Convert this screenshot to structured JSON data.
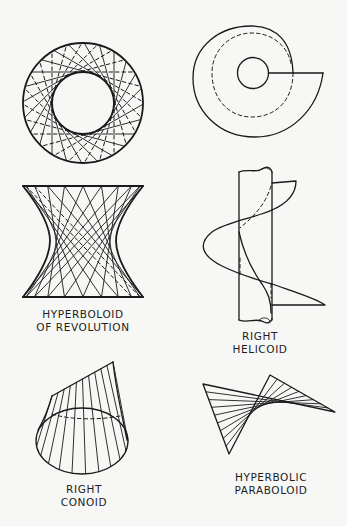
{
  "figures": [
    {
      "id": "hyperboloid",
      "label_lines": [
        "HYPERBOLOID",
        "OF REVOLUTION"
      ],
      "views": [
        "top-view",
        "side-view"
      ]
    },
    {
      "id": "helicoid",
      "label_lines": [
        "RIGHT",
        "HELICOID"
      ],
      "views": [
        "top-view",
        "side-view"
      ]
    },
    {
      "id": "conoid",
      "label_lines": [
        "RIGHT",
        "CONOID"
      ],
      "views": [
        "perspective"
      ]
    },
    {
      "id": "hyperbolic-paraboloid",
      "label_lines": [
        "HYPERBOLIC",
        "PARABOLOID"
      ],
      "views": [
        "perspective"
      ]
    }
  ],
  "colors": {
    "ink": "#1a1a1a",
    "paper": "#f7f7f5"
  }
}
